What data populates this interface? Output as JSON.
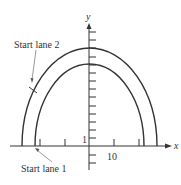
{
  "diagram": {
    "type": "track-lanes-semi-ellipses",
    "axes": {
      "x_label": "x",
      "y_label": "y",
      "x_tick_label": "10",
      "y_tick_label": "1",
      "x_tick_spacing_units": 5,
      "y_tick_spacing_units": 1
    },
    "annotations": {
      "start_lane_2": "Start lane 2",
      "start_lane_1": "Start lane 1"
    },
    "curves": [
      {
        "name": "outer lane",
        "half_width_units": 27,
        "height_units": 12
      },
      {
        "name": "inner lane",
        "half_width_units": 22,
        "height_units": 10
      }
    ],
    "colors": {
      "line": "#333333",
      "background": "#ffffff"
    }
  }
}
